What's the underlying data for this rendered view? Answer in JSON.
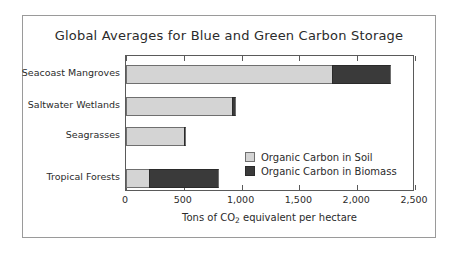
{
  "chart_data": {
    "type": "bar",
    "orientation": "horizontal",
    "stacked": true,
    "title": "Global Averages for Blue and Green Carbon Storage",
    "xlabel": "Tons of CO2 equivalent per hectare",
    "xlabel_parts": {
      "before": "Tons of CO",
      "sub": "2",
      "after": " equivalent per hectare"
    },
    "ylabel": "",
    "categories": [
      "Seacoast Mangroves",
      "Saltwater Wetlands",
      "Seagrasses",
      "Tropical Forests"
    ],
    "series": [
      {
        "name": "Organic Carbon in Soil",
        "color": "#d4d4d4",
        "values": [
          1780,
          920,
          500,
          200
        ]
      },
      {
        "name": "Organic Carbon in Biomass",
        "color": "#3a3a3a",
        "values": [
          510,
          30,
          20,
          605
        ]
      }
    ],
    "totals": [
      2290,
      950,
      520,
      805
    ],
    "xlim": [
      0,
      2500
    ],
    "xticks": [
      0,
      500,
      1000,
      1500,
      2000,
      2500
    ],
    "xtick_labels": [
      "0",
      "500",
      "1,000",
      "1,500",
      "2,000",
      "2,500"
    ],
    "grid": false,
    "legend_position": "inside-lower-right"
  },
  "legend": {
    "items": [
      {
        "label": "Organic Carbon in Soil",
        "swatch": "soil"
      },
      {
        "label": "Organic Carbon in Biomass",
        "swatch": "biomass"
      }
    ]
  },
  "colors": {
    "soil": "#d4d4d4",
    "biomass": "#3a3a3a",
    "axis": "#5a5a5a",
    "frame": "#9a9a9a",
    "text": "#2b2b2b",
    "background": "#ffffff"
  }
}
